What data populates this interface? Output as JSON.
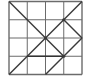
{
  "diagram": {
    "type": "grid-with-diagonals",
    "grid": {
      "rows": 4,
      "cols": 4
    },
    "frame": {
      "left": 9,
      "top": 1.5,
      "size": 73
    },
    "colors": {
      "background": "#ffffff",
      "grid": "#6b6b6b",
      "diagonal": "#3a3a3a",
      "emphasis": "#333333"
    },
    "segments": [
      {
        "from": [
          0,
          0
        ],
        "to": [
          3,
          3
        ],
        "kind": "diagonal"
      },
      {
        "from": [
          0,
          4
        ],
        "to": [
          4,
          0
        ],
        "kind": "diagonal"
      },
      {
        "from": [
          3,
          1
        ],
        "to": [
          4,
          2
        ],
        "kind": "diagonal"
      },
      {
        "from": [
          4,
          2
        ],
        "to": [
          2,
          4
        ],
        "kind": "diagonal"
      },
      {
        "from": [
          1,
          3
        ],
        "to": [
          3,
          3
        ],
        "kind": "emphasis"
      }
    ],
    "points": [
      {
        "at": [
          2,
          2
        ],
        "label": "center"
      },
      {
        "at": [
          3,
          1
        ],
        "label": "upper-right-node"
      },
      {
        "at": [
          3,
          3
        ],
        "label": "lower-right-node"
      }
    ]
  }
}
